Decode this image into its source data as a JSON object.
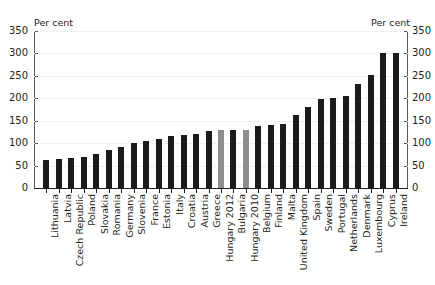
{
  "figure": {
    "title_remnant": "",
    "unit_label_left": "Per cent",
    "unit_label_right": "Per cent"
  },
  "chart_data": {
    "type": "bar",
    "title": "",
    "subtitle": "",
    "xlabel": "",
    "ylabel": "Per cent",
    "ylabel_right": "Per cent",
    "ylim": [
      0,
      350
    ],
    "yticks": [
      0,
      50,
      100,
      150,
      200,
      250,
      300,
      350
    ],
    "ytick_labels": [
      "0",
      "50",
      "100",
      "150",
      "200",
      "250",
      "300",
      "350"
    ],
    "grid": true,
    "legend": null,
    "categories": [
      "Lithuania",
      "Latvia",
      "Czech Republic",
      "Poland",
      "Slovakia",
      "Romania",
      "Germany",
      "Slovenia",
      "France",
      "Estonia",
      "Italy",
      "Croatia",
      "Austria",
      "Greece",
      "Hungary 2012",
      "Bulgaria",
      "Hungary 2010",
      "Belgium",
      "Finland",
      "Malta",
      "United Kingdom",
      "Spain",
      "Sweden",
      "Portugal",
      "Netherlands",
      "Denmark",
      "Luxembourg",
      "Cyprus",
      "Ireland"
    ],
    "values": [
      63,
      65,
      68,
      70,
      76,
      85,
      92,
      100,
      105,
      110,
      117,
      119,
      120,
      127,
      130,
      130,
      130,
      138,
      140,
      142,
      162,
      180,
      199,
      200,
      205,
      232,
      252,
      302,
      300
    ],
    "colors": [
      "#1b1b1b",
      "#1b1b1b",
      "#1b1b1b",
      "#1b1b1b",
      "#1b1b1b",
      "#1b1b1b",
      "#1b1b1b",
      "#1b1b1b",
      "#1b1b1b",
      "#1b1b1b",
      "#1b1b1b",
      "#1b1b1b",
      "#1b1b1b",
      "#1b1b1b",
      "#8e8e8e",
      "#1b1b1b",
      "#8e8e8e",
      "#1b1b1b",
      "#1b1b1b",
      "#1b1b1b",
      "#1b1b1b",
      "#1b1b1b",
      "#1b1b1b",
      "#1b1b1b",
      "#1b1b1b",
      "#1b1b1b",
      "#1b1b1b",
      "#1b1b1b",
      "#1b1b1b"
    ],
    "highlight_color": "#8e8e8e",
    "series_color": "#1b1b1b"
  }
}
